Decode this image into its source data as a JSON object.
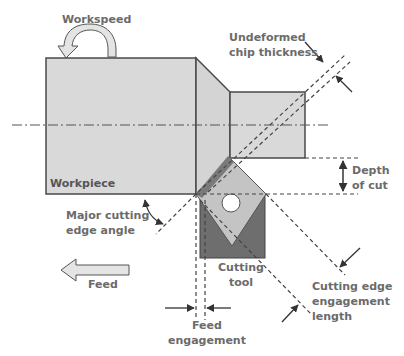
{
  "diagram": {
    "labels": {
      "workspeed": "Workspeed",
      "undeformed_chip_thickness": [
        "Undeformed",
        "chip thickness"
      ],
      "depth_of_cut": [
        "Depth",
        "of cut"
      ],
      "workpiece": "Workpiece",
      "major_cutting_edge_angle": [
        "Major cutting",
        "edge angle"
      ],
      "feed": "Feed",
      "cutting_tool": [
        "Cutting",
        "tool"
      ],
      "cutting_edge_engagement_length": [
        "Cutting edge",
        "engagement",
        "length"
      ],
      "feed_engagement": [
        "Feed",
        "engagement"
      ]
    },
    "colors": {
      "workpiece_fill": "#d9d9d9",
      "tool_insert_fill": "#c4c4c4",
      "tool_shank_fill": "#6e6e6e",
      "cutting_edge_fill": "#7a7a7a",
      "outline": "#4a4a4a",
      "label_text": "#6b6b6b",
      "arrow_fill": "#e4e4e4"
    }
  }
}
